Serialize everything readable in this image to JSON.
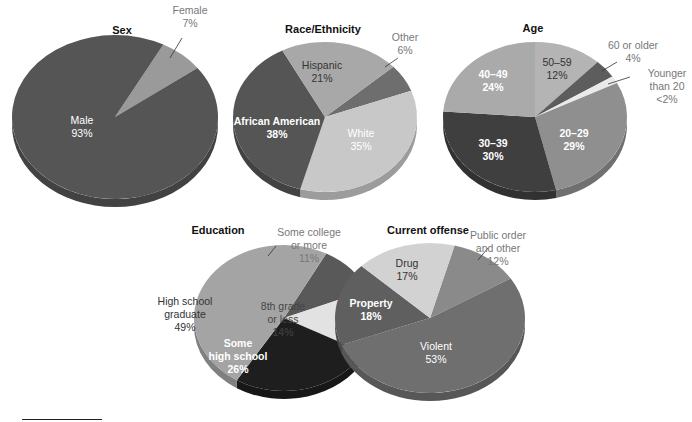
{
  "chart_data": [
    {
      "type": "pie",
      "title": "Sex",
      "center": [
        115,
        117
      ],
      "rx": 103,
      "ry": 82,
      "depth": 8,
      "start_angle": -62,
      "title_pos": [
        122,
        24
      ],
      "slices": [
        {
          "label": "Female",
          "value": 7,
          "display": "7%",
          "color": "#9a9a9a",
          "label_pos": [
            190,
            17
          ],
          "label_color": "#777777",
          "bold": false,
          "leader": [
            [
              182,
              38
            ],
            [
              170,
              58
            ]
          ]
        },
        {
          "label": "Male",
          "value": 93,
          "display": "93%",
          "color": "#555555",
          "label_pos": [
            82,
            127
          ],
          "label_color": "#ffffff",
          "bold": false
        }
      ]
    },
    {
      "type": "pie",
      "title": "Race/Ethnicity",
      "center": [
        325,
        117
      ],
      "rx": 92,
      "ry": 75,
      "depth": 8,
      "start_angle": -42,
      "title_pos": [
        323,
        23
      ],
      "slices": [
        {
          "label": "Other",
          "value": 6,
          "display": "6%",
          "color": "#6e6e6e",
          "label_pos": [
            405,
            44
          ],
          "label_color": "#777777",
          "bold": false,
          "leader": [
            [
              398,
              58
            ],
            [
              385,
              67
            ]
          ]
        },
        {
          "label": "White",
          "value": 35,
          "display": "35%",
          "color": "#c8c8c8",
          "label_pos": [
            361,
            140
          ],
          "label_color": "#ffffff",
          "bold": false
        },
        {
          "label": "African American",
          "value": 38,
          "display": "38%",
          "color": "#555555",
          "label_pos": [
            277,
            128
          ],
          "label_color": "#ffffff",
          "bold": true
        },
        {
          "label": "Hispanic",
          "value": 21,
          "display": "21%",
          "color": "#a8a8a8",
          "label_pos": [
            322,
            72
          ],
          "label_color": "#333333",
          "bold": false
        }
      ]
    },
    {
      "type": "pie",
      "title": "Age",
      "center": [
        535,
        117
      ],
      "rx": 92,
      "ry": 75,
      "depth": 8,
      "start_angle": -90,
      "title_pos": [
        533,
        22
      ],
      "slices": [
        {
          "label": "50–59",
          "value": 12,
          "display": "12%",
          "color": "#b4b4b4",
          "label_pos": [
            557,
            69
          ],
          "label_color": "#333333",
          "bold": false
        },
        {
          "label": "60 or older",
          "value": 4,
          "display": "4%",
          "color": "#5d5d5d",
          "label_pos": [
            633,
            52
          ],
          "label_color": "#777777",
          "bold": false,
          "leader": [
            [
              617,
              62
            ],
            [
              602,
              71
            ]
          ]
        },
        {
          "label": "Younger than 20",
          "value": 1.6,
          "display": "<2%",
          "color": "#eaeaea",
          "label_pos": [
            667,
            86
          ],
          "label_color": "#777777",
          "bold": false,
          "leader": [
            [
              630,
              77
            ],
            [
              608,
              84
            ]
          ],
          "multiline": [
            "Younger",
            "than 20",
            "<2%"
          ]
        },
        {
          "label": "20–29",
          "value": 29,
          "display": "29%",
          "color": "#8f8f8f",
          "label_pos": [
            574,
            140
          ],
          "label_color": "#ffffff",
          "bold": true
        },
        {
          "label": "30–39",
          "value": 30,
          "display": "30%",
          "color": "#3f3f3f",
          "label_pos": [
            493,
            150
          ],
          "label_color": "#ffffff",
          "bold": true
        },
        {
          "label": "40–49",
          "value": 24,
          "display": "24%",
          "color": "#aaaaaa",
          "label_pos": [
            493,
            81
          ],
          "label_color": "#ffffff",
          "bold": true
        }
      ]
    },
    {
      "type": "pie",
      "title": "Education",
      "center": [
        284,
        318
      ],
      "rx": 90,
      "ry": 73,
      "depth": 8,
      "start_angle": -62,
      "title_pos": [
        218,
        224
      ],
      "slices": [
        {
          "label": "Some college or more",
          "value": 11,
          "display": "11%",
          "color": "#595959",
          "label_pos": [
            309,
            245
          ],
          "label_color": "#777777",
          "bold": false,
          "leader": [
            [
              276,
              246
            ],
            [
              268,
              256
            ]
          ],
          "multiline": [
            "Some college",
            "or more",
            "11%"
          ]
        },
        {
          "label": "8th grade or less",
          "value": 14,
          "display": "14%",
          "color": "#e2e2e2",
          "label_pos": [
            283,
            319
          ],
          "label_color": "#444444",
          "bold": false,
          "multiline": [
            "8th grade",
            "or less",
            "14%"
          ]
        },
        {
          "label": "Some high school",
          "value": 26,
          "display": "26%",
          "color": "#1e1e1e",
          "label_pos": [
            238,
            356
          ],
          "label_color": "#ffffff",
          "bold": true,
          "multiline": [
            "Some",
            "high school",
            "26%"
          ]
        },
        {
          "label": "High school graduate",
          "value": 49,
          "display": "49%",
          "color": "#a4a4a4",
          "label_pos": [
            185,
            314
          ],
          "label_color": "#333333",
          "bold": false,
          "multiline": [
            "High school",
            "graduate",
            "49%"
          ]
        }
      ]
    },
    {
      "type": "pie",
      "title": "Current offense",
      "center": [
        430,
        318
      ],
      "rx": 95,
      "ry": 75,
      "depth": 8,
      "start_angle": -75,
      "title_pos": [
        428,
        224
      ],
      "slices": [
        {
          "label": "Public order and other",
          "value": 12,
          "display": "12%",
          "color": "#8a8a8a",
          "label_pos": [
            498,
            248
          ],
          "label_color": "#777777",
          "bold": false,
          "leader": [
            [
              488,
              248
            ],
            [
              478,
              260
            ]
          ],
          "multiline": [
            "Public order",
            "and other",
            "12%"
          ]
        },
        {
          "label": "Violent",
          "value": 53,
          "display": "53%",
          "color": "#6f6f6f",
          "label_pos": [
            436,
            353
          ],
          "label_color": "#ffffff",
          "bold": false
        },
        {
          "label": "Property",
          "value": 18,
          "display": "18%",
          "color": "#5f5f5f",
          "label_pos": [
            371,
            310
          ],
          "label_color": "#ffffff",
          "bold": true
        },
        {
          "label": "Drug",
          "value": 17,
          "display": "17%",
          "color": "#d2d2d2",
          "label_pos": [
            407,
            270
          ],
          "label_color": "#333333",
          "bold": false
        }
      ]
    }
  ]
}
